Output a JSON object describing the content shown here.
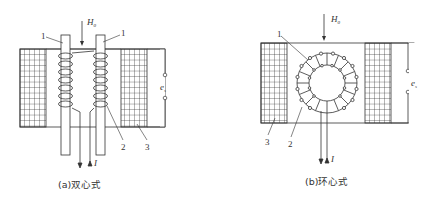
{
  "figure_a": {
    "caption": "(a)双心式",
    "field_label": "H",
    "field_sub": "0",
    "output_label": "e",
    "output_sub": "s",
    "current_label": "I",
    "parts": {
      "core": "1",
      "core_right": "1",
      "coil": "2",
      "pickup": "3"
    }
  },
  "figure_b": {
    "caption": "(b)环心式",
    "field_label": "H",
    "field_sub": "0",
    "output_label": "e",
    "output_sub": "s",
    "current_label": "I",
    "parts": {
      "core": "1",
      "coil": "2",
      "pickup": "3"
    }
  },
  "colors": {
    "line": "#333333",
    "background": "#ffffff"
  }
}
